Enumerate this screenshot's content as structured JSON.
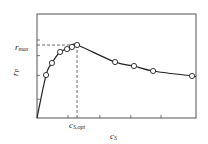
{
  "chart_data": {
    "type": "line",
    "title": "",
    "xlabel": "c_S",
    "ylabel": "r_P",
    "xlabel_main": "c",
    "xlabel_sub": "S",
    "ylabel_main": "r",
    "ylabel_sub": "P",
    "annotations": [
      {
        "text": "r_max",
        "main": "r",
        "sub": "max",
        "type": "horizontal-dashed-line",
        "y": 0.73
      },
      {
        "text": "c_S,opt",
        "main": "c",
        "sub": "S,opt",
        "type": "vertical-dashed-line",
        "x": 0.25
      }
    ],
    "xlim": [
      0,
      1
    ],
    "ylim": [
      0,
      1
    ],
    "grid": false,
    "legend": null,
    "x_ticks": [
      0.195,
      0.395,
      0.59,
      0.78
    ],
    "y_ticks": [
      0.18,
      0.41,
      0.6,
      0.75
    ],
    "series": [
      {
        "name": "r_P vs c_S",
        "marker": "open-circle",
        "points": [
          {
            "x": 0.057,
            "y": 0.413
          },
          {
            "x": 0.094,
            "y": 0.529
          },
          {
            "x": 0.145,
            "y": 0.635
          },
          {
            "x": 0.189,
            "y": 0.663
          },
          {
            "x": 0.22,
            "y": 0.683
          },
          {
            "x": 0.252,
            "y": 0.702
          },
          {
            "x": 0.491,
            "y": 0.538
          },
          {
            "x": 0.61,
            "y": 0.5
          },
          {
            "x": 0.73,
            "y": 0.452
          },
          {
            "x": 0.975,
            "y": 0.404
          }
        ],
        "curve_starts_at_origin": true
      }
    ]
  }
}
